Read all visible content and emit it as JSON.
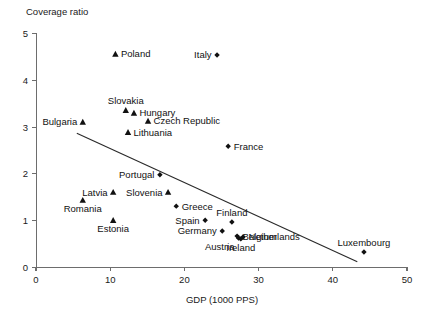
{
  "chart_data": {
    "type": "scatter",
    "title": "",
    "xlabel": "GDP (1000 PPS)",
    "ylabel": "Coverage ratio",
    "xlim": [
      0,
      50
    ],
    "ylim": [
      0,
      5
    ],
    "xticks": [
      "0",
      "10",
      "20",
      "30",
      "40",
      "50"
    ],
    "yticks": [
      "0",
      "1",
      "2",
      "3",
      "4",
      "5"
    ],
    "grid": false,
    "legend": "none",
    "marker_shapes": [
      "triangle",
      "diamond"
    ],
    "points": [
      {
        "name": "Poland",
        "x": 10.7,
        "y": 4.55,
        "marker": "triangle",
        "label_side": "right"
      },
      {
        "name": "Italy",
        "x": 24.4,
        "y": 4.53,
        "marker": "diamond",
        "label_side": "left"
      },
      {
        "name": "Slovakia",
        "x": 12.1,
        "y": 3.35,
        "marker": "triangle",
        "label_side": "above"
      },
      {
        "name": "Hungary",
        "x": 13.2,
        "y": 3.29,
        "marker": "triangle",
        "label_side": "right"
      },
      {
        "name": "Czech Republic",
        "x": 15.1,
        "y": 3.12,
        "marker": "triangle",
        "label_side": "right"
      },
      {
        "name": "Bulgaria",
        "x": 6.3,
        "y": 3.1,
        "marker": "triangle",
        "label_side": "left"
      },
      {
        "name": "Lithuania",
        "x": 12.4,
        "y": 2.88,
        "marker": "triangle",
        "label_side": "right"
      },
      {
        "name": "France",
        "x": 25.9,
        "y": 2.58,
        "marker": "diamond",
        "label_side": "right"
      },
      {
        "name": "Portugal",
        "x": 16.7,
        "y": 1.97,
        "marker": "diamond",
        "label_side": "left"
      },
      {
        "name": "Latvia",
        "x": 10.4,
        "y": 1.6,
        "marker": "triangle",
        "label_side": "left"
      },
      {
        "name": "Slovenia",
        "x": 17.8,
        "y": 1.6,
        "marker": "triangle",
        "label_side": "left"
      },
      {
        "name": "Romania",
        "x": 6.3,
        "y": 1.43,
        "marker": "triangle",
        "label_side": "below"
      },
      {
        "name": "Greece",
        "x": 18.9,
        "y": 1.3,
        "marker": "diamond",
        "label_side": "right"
      },
      {
        "name": "Estonia",
        "x": 10.4,
        "y": 1.0,
        "marker": "triangle",
        "label_side": "below"
      },
      {
        "name": "Spain",
        "x": 22.8,
        "y": 1.0,
        "marker": "diamond",
        "label_side": "left"
      },
      {
        "name": "Finland",
        "x": 26.4,
        "y": 0.96,
        "marker": "diamond",
        "label_side": "above"
      },
      {
        "name": "Germany",
        "x": 25.1,
        "y": 0.77,
        "marker": "diamond",
        "label_side": "left"
      },
      {
        "name": "Belgium",
        "x": 27.1,
        "y": 0.66,
        "marker": "diamond",
        "label_side": "right"
      },
      {
        "name": "Netherlands",
        "x": 27.9,
        "y": 0.64,
        "marker": "diamond",
        "label_side": "right"
      },
      {
        "name": "Austria",
        "x": 27.3,
        "y": 0.62,
        "marker": "diamond",
        "label_side": "below-left"
      },
      {
        "name": "Ireland",
        "x": 27.6,
        "y": 0.6,
        "marker": "diamond",
        "label_side": "below"
      },
      {
        "name": "Luxembourg",
        "x": 44.2,
        "y": 0.32,
        "marker": "diamond",
        "label_side": "above"
      }
    ],
    "trend_line": {
      "x1": 5.5,
      "y1": 2.86,
      "x2": 43.3,
      "y2": 0.11
    }
  }
}
